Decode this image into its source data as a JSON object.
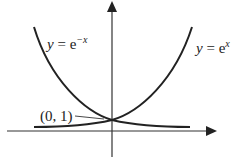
{
  "diagram": {
    "type": "function-graph",
    "curves": [
      {
        "name": "exp-neg-x",
        "label_y": "y",
        "label_eq": " = e",
        "label_exp": "−x"
      },
      {
        "name": "exp-x",
        "label_y": "y",
        "label_eq": " = e",
        "label_exp": "x"
      }
    ],
    "intersection_label": "(0, 1)",
    "colors": {
      "stroke": "#222222",
      "background": "#ffffff"
    }
  }
}
